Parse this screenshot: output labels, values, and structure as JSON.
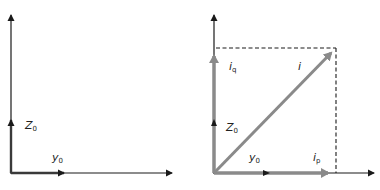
{
  "colors": {
    "axis": "#1a1a1a",
    "current_vector": "#8a8a8a",
    "dashed": "#1a1a1a",
    "background": "#ffffff"
  },
  "left_panel": {
    "labels": {
      "z0": {
        "main": "Z",
        "sub": "0"
      },
      "y0": {
        "main": "y",
        "sub": "0"
      }
    }
  },
  "right_panel": {
    "labels": {
      "iq": {
        "main": "i",
        "sub": "q"
      },
      "i": {
        "main": "i"
      },
      "z0": {
        "main": "Z",
        "sub": "0"
      },
      "y0": {
        "main": "y",
        "sub": "0"
      },
      "ip": {
        "main": "i",
        "sub": "p"
      }
    }
  }
}
